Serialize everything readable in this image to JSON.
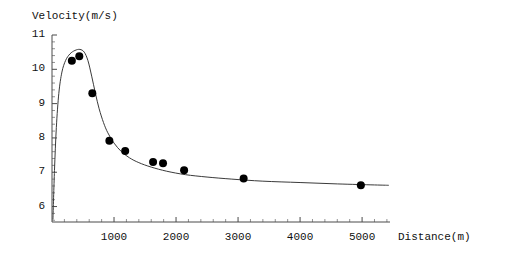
{
  "chart_data": {
    "type": "scatter",
    "title": "",
    "xlabel": "Distance(m)",
    "ylabel": "Velocity(m/s)",
    "xlim": [
      0,
      5450
    ],
    "ylim": [
      5.55,
      11.0
    ],
    "grid": false,
    "legend": null,
    "x_ticks": [
      1000,
      2000,
      3000,
      4000,
      5000
    ],
    "x_tick_labels": [
      "1000",
      "2000",
      "3000",
      "4000",
      "5000"
    ],
    "x_minor_tick_step": 200,
    "y_ticks": [
      6,
      7,
      8,
      9,
      10,
      11
    ],
    "y_tick_labels": [
      "6",
      "7",
      "8",
      "9",
      "10",
      "11"
    ],
    "y_minor_tick_step": 0.2,
    "marker_color": "#000000",
    "line_color": "#3a3a3a",
    "axis_color": "#4a4a4a",
    "points": [
      {
        "x": 320,
        "y": 10.25
      },
      {
        "x": 440,
        "y": 10.38
      },
      {
        "x": 650,
        "y": 9.3
      },
      {
        "x": 925,
        "y": 7.92
      },
      {
        "x": 1180,
        "y": 7.62
      },
      {
        "x": 1630,
        "y": 7.3
      },
      {
        "x": 1790,
        "y": 7.26
      },
      {
        "x": 2130,
        "y": 7.06
      },
      {
        "x": 3090,
        "y": 6.82
      },
      {
        "x": 4980,
        "y": 6.62
      }
    ],
    "fit_curve": [
      {
        "x": 15,
        "y": 5.62
      },
      {
        "x": 40,
        "y": 7.05
      },
      {
        "x": 70,
        "y": 8.3
      },
      {
        "x": 110,
        "y": 9.3
      },
      {
        "x": 160,
        "y": 9.92
      },
      {
        "x": 220,
        "y": 10.26
      },
      {
        "x": 290,
        "y": 10.45
      },
      {
        "x": 370,
        "y": 10.55
      },
      {
        "x": 450,
        "y": 10.58
      },
      {
        "x": 520,
        "y": 10.5
      },
      {
        "x": 580,
        "y": 10.25
      },
      {
        "x": 640,
        "y": 9.8
      },
      {
        "x": 700,
        "y": 9.3
      },
      {
        "x": 760,
        "y": 8.85
      },
      {
        "x": 830,
        "y": 8.45
      },
      {
        "x": 900,
        "y": 8.15
      },
      {
        "x": 1000,
        "y": 7.85
      },
      {
        "x": 1120,
        "y": 7.6
      },
      {
        "x": 1250,
        "y": 7.42
      },
      {
        "x": 1400,
        "y": 7.28
      },
      {
        "x": 1600,
        "y": 7.15
      },
      {
        "x": 1850,
        "y": 7.03
      },
      {
        "x": 2150,
        "y": 6.93
      },
      {
        "x": 2500,
        "y": 6.86
      },
      {
        "x": 2900,
        "y": 6.8
      },
      {
        "x": 3400,
        "y": 6.74
      },
      {
        "x": 4000,
        "y": 6.7
      },
      {
        "x": 4600,
        "y": 6.66
      },
      {
        "x": 5200,
        "y": 6.63
      },
      {
        "x": 5430,
        "y": 6.62
      }
    ]
  },
  "labels": {
    "y_axis_title": "Velocity(m/s)",
    "x_axis_title": "Distance(m)"
  }
}
